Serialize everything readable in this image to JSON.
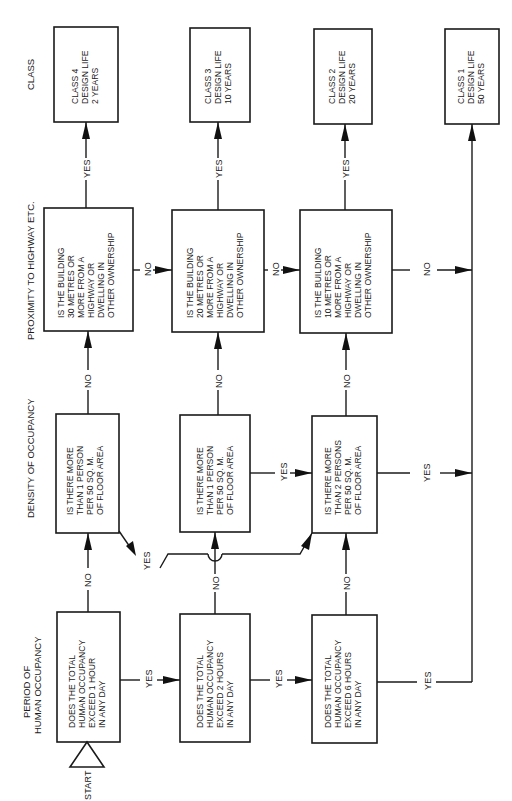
{
  "diagram": {
    "orientation": "rotated 90 degrees counter-clockwise",
    "column_headers": {
      "period": [
        "PERIOD OF",
        "HUMAN OCCUPANCY"
      ],
      "density": [
        "DENSITY OF OCCUPANCY"
      ],
      "proximity": [
        "PROXIMITY TO HIGHWAY ETC."
      ],
      "class": [
        "CLASS"
      ]
    },
    "start_label": "START",
    "edge_labels": {
      "yes": "YES",
      "no": "NO"
    },
    "nodes": {
      "occ1": [
        "DOES THE TOTAL",
        "HUMAN OCCUPANCY",
        "EXCEED 1 HOUR",
        "IN ANY DAY"
      ],
      "occ2": [
        "DOES THE TOTAL",
        "HUMAN OCCUPANCY",
        "EXCEED 2 HOURS",
        "IN ANY DAY"
      ],
      "occ6": [
        "DOES THE TOTAL",
        "HUMAN OCCUPANCY",
        "EXCEED 6 HOURS",
        "IN ANY DAY"
      ],
      "den1a": [
        "IS THERE MORE",
        "THAN 1 PERSON",
        "PER 50 SQ. M.",
        "OF FLOOR AREA"
      ],
      "den1b": [
        "IS THERE MORE",
        "THAN 1 PERSON",
        "PER 50 SQ. M.",
        "OF FLOOR AREA"
      ],
      "den2": [
        "IS THERE MORE",
        "THAN 2 PERSONS",
        "PER 50 SQ. M.",
        "OF FLOOR AREA"
      ],
      "prox30": [
        "IS THE BUILDING",
        "30 METRES OR",
        "MORE FROM A",
        "HIGHWAY OR",
        "DWELLING IN",
        "OTHER OWNERSHIP"
      ],
      "prox20": [
        "IS THE BUILDING",
        "20 METRES OR",
        "MORE FROM A",
        "HIGHWAY OR",
        "DWELLING IN",
        "OTHER OWNERSHIP"
      ],
      "prox10": [
        "IS THE BUILDING",
        "10 METRES OR",
        "MORE FROM A",
        "HIGHWAY OR",
        "DWELLING IN",
        "OTHER OWNERSHIP"
      ],
      "class4": [
        "CLASS 4",
        "DESIGN LIFE",
        "2 YEARS"
      ],
      "class3": [
        "CLASS 3",
        "DESIGN LIFE",
        "10 YEARS"
      ],
      "class2": [
        "CLASS 2",
        "DESIGN LIFE",
        "20 YEARS"
      ],
      "class1": [
        "CLASS 1",
        "DESIGN LIFE",
        "50 YEARS"
      ]
    },
    "flow": [
      {
        "from": "START",
        "to": "occ1"
      },
      {
        "from": "occ1",
        "label": "NO",
        "to": "den1a"
      },
      {
        "from": "occ1",
        "label": "YES",
        "to": "occ2"
      },
      {
        "from": "den1a",
        "label": "NO",
        "to": "prox30"
      },
      {
        "from": "den1a",
        "label": "YES",
        "to": "den2"
      },
      {
        "from": "prox30",
        "label": "YES",
        "to": "class4"
      },
      {
        "from": "prox30",
        "label": "NO",
        "to": "prox20"
      },
      {
        "from": "occ2",
        "label": "NO",
        "to": "den1b"
      },
      {
        "from": "occ2",
        "label": "YES",
        "to": "occ6"
      },
      {
        "from": "den1b",
        "label": "NO",
        "to": "prox20"
      },
      {
        "from": "den1b",
        "label": "YES",
        "to": "den2"
      },
      {
        "from": "prox20",
        "label": "YES",
        "to": "class3"
      },
      {
        "from": "prox20",
        "label": "NO",
        "to": "prox10"
      },
      {
        "from": "occ6",
        "label": "NO",
        "to": "den2"
      },
      {
        "from": "occ6",
        "label": "YES",
        "to": "class1"
      },
      {
        "from": "den2",
        "label": "NO",
        "to": "prox10"
      },
      {
        "from": "den2",
        "label": "YES",
        "to": "class1"
      },
      {
        "from": "prox10",
        "label": "YES",
        "to": "class2"
      },
      {
        "from": "prox10",
        "label": "NO",
        "to": "class1"
      }
    ]
  }
}
